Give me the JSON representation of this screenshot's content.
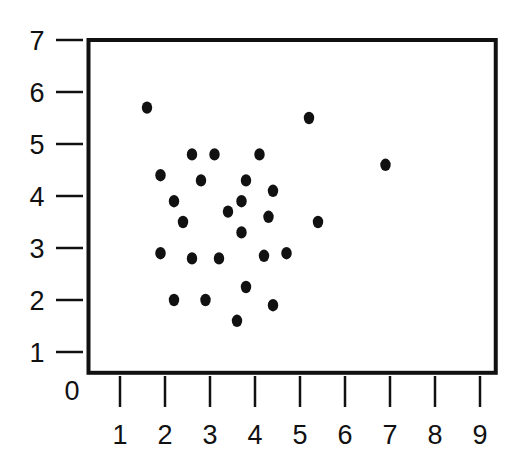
{
  "chart_data": {
    "type": "scatter",
    "title": "",
    "xlabel": "",
    "ylabel": "",
    "xlim": [
      0.3,
      9.35
    ],
    "ylim": [
      0.6,
      7.0
    ],
    "origin_label": "0",
    "x_ticks": [
      1,
      2,
      3,
      4,
      5,
      6,
      7,
      8,
      9
    ],
    "x_tick_labels": [
      "1",
      "2",
      "3",
      "4",
      "5",
      "6",
      "7",
      "8",
      "9"
    ],
    "y_ticks": [
      1,
      2,
      3,
      4,
      5,
      6,
      7
    ],
    "y_tick_labels": [
      "1",
      "2",
      "3",
      "4",
      "5",
      "6",
      "7"
    ],
    "grid": false,
    "legend": null,
    "marker_color": "#111111",
    "frame_color": "#111111",
    "points": [
      {
        "x": 1.6,
        "y": 5.7
      },
      {
        "x": 5.2,
        "y": 5.5
      },
      {
        "x": 4.1,
        "y": 4.8
      },
      {
        "x": 2.6,
        "y": 4.8
      },
      {
        "x": 3.1,
        "y": 4.8
      },
      {
        "x": 6.9,
        "y": 4.6
      },
      {
        "x": 1.9,
        "y": 4.4
      },
      {
        "x": 2.8,
        "y": 4.3
      },
      {
        "x": 3.8,
        "y": 4.3
      },
      {
        "x": 4.4,
        "y": 4.1
      },
      {
        "x": 2.2,
        "y": 3.9
      },
      {
        "x": 3.7,
        "y": 3.9
      },
      {
        "x": 3.4,
        "y": 3.7
      },
      {
        "x": 4.3,
        "y": 3.6
      },
      {
        "x": 5.4,
        "y": 3.5
      },
      {
        "x": 2.4,
        "y": 3.5
      },
      {
        "x": 3.7,
        "y": 3.3
      },
      {
        "x": 1.9,
        "y": 2.9
      },
      {
        "x": 2.6,
        "y": 2.8
      },
      {
        "x": 3.2,
        "y": 2.8
      },
      {
        "x": 4.2,
        "y": 2.85
      },
      {
        "x": 4.7,
        "y": 2.9
      },
      {
        "x": 3.8,
        "y": 2.25
      },
      {
        "x": 2.2,
        "y": 2.0
      },
      {
        "x": 2.9,
        "y": 2.0
      },
      {
        "x": 4.4,
        "y": 1.9
      },
      {
        "x": 3.6,
        "y": 1.6
      }
    ]
  }
}
